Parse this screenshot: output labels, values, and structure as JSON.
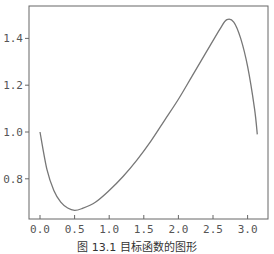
{
  "chart_data": {
    "type": "line",
    "title": "",
    "caption": "图 13.1  目标函数的图形",
    "xlabel": "",
    "ylabel": "",
    "xlim": [
      -0.16,
      3.3
    ],
    "ylim": [
      0.635,
      1.53
    ],
    "x_ticks": [
      "0.0",
      "0.5",
      "1.0",
      "1.5",
      "2.0",
      "2.5",
      "3.0"
    ],
    "y_ticks": [
      "0.8",
      "1.0",
      "1.2",
      "1.4"
    ],
    "grid": false,
    "series": [
      {
        "name": "f(x)",
        "x": [
          0.0,
          0.1,
          0.2,
          0.3,
          0.4,
          0.5,
          0.6,
          0.8,
          1.0,
          1.2,
          1.4,
          1.6,
          1.8,
          2.0,
          2.2,
          2.4,
          2.6,
          2.7,
          2.8,
          2.9,
          3.0,
          3.1,
          3.14
        ],
        "y": [
          1.0,
          0.84,
          0.75,
          0.7,
          0.675,
          0.665,
          0.672,
          0.7,
          0.75,
          0.81,
          0.88,
          0.96,
          1.05,
          1.14,
          1.24,
          1.34,
          1.44,
          1.48,
          1.47,
          1.4,
          1.28,
          1.1,
          0.99
        ]
      }
    ],
    "colors": {
      "line": "#777777",
      "axis": "#555555"
    }
  }
}
